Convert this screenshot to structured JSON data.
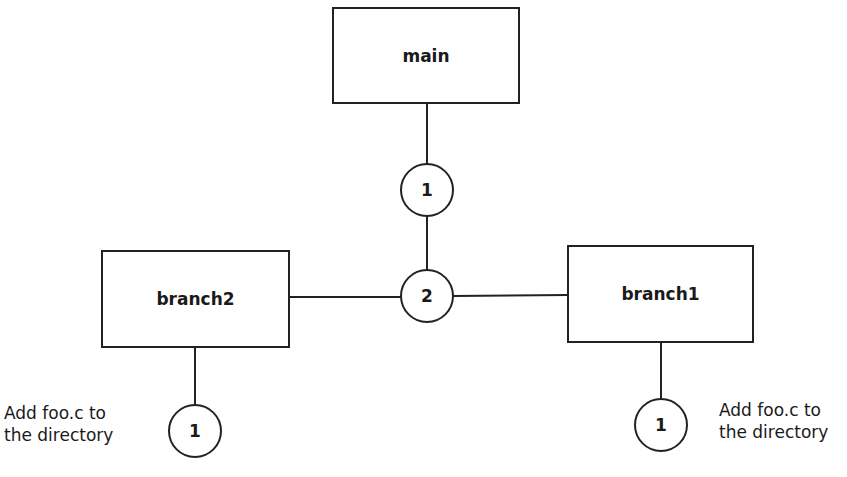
{
  "diagram": {
    "boxes": {
      "main": {
        "label": "main"
      },
      "branch2": {
        "label": "branch2"
      },
      "branch1": {
        "label": "branch1"
      }
    },
    "nodes": {
      "main_1": {
        "label": "1"
      },
      "merge_2": {
        "label": "2"
      },
      "branch2_1": {
        "label": "1"
      },
      "branch1_1": {
        "label": "1"
      }
    },
    "annotations": {
      "branch2_note": {
        "line1": "Add foo.c to",
        "line2": "the directory"
      },
      "branch1_note": {
        "line1": "Add foo.c to",
        "line2": "the directory"
      }
    },
    "edges": [
      {
        "from": "main",
        "to": "main_1"
      },
      {
        "from": "main_1",
        "to": "merge_2"
      },
      {
        "from": "branch2",
        "to": "merge_2"
      },
      {
        "from": "merge_2",
        "to": "branch1"
      },
      {
        "from": "branch2",
        "to": "branch2_1"
      },
      {
        "from": "branch1",
        "to": "branch1_1"
      }
    ],
    "colors": {
      "stroke": "#222222",
      "background": "#ffffff"
    }
  }
}
